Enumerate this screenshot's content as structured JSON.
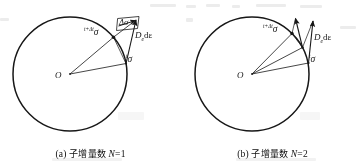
{
  "figure": {
    "kind": "scanned-textbook-figure",
    "background": "#ffffff",
    "ink": "#1a1a1a"
  },
  "panels": [
    {
      "id": "a",
      "caption_prefix": "(a)",
      "caption_cn": "子增量数",
      "caption_var": "N",
      "caption_value": "=1",
      "caption_full": "(a) 子增量数 N=1",
      "circle": {
        "cx": 70,
        "cy": 74,
        "r": 57,
        "label_center": "O"
      },
      "labels": {
        "stress_new": "σ",
        "stress_new_sup": "t+Δt",
        "stress_old": "σ",
        "stress_old_sup": "t",
        "delta_sigma": "Δσ",
        "elastic_trial": "D",
        "elastic_trial_sub": "e",
        "elastic_trial_tail": "dε"
      },
      "subincrements": 1
    },
    {
      "id": "b",
      "caption_prefix": "(b)",
      "caption_cn": "子增量数",
      "caption_var": "N",
      "caption_value": "=2",
      "caption_full": "(b) 子增量数 N=2",
      "circle": {
        "cx": 70,
        "cy": 74,
        "r": 57,
        "label_center": "O"
      },
      "labels": {
        "stress_new": "σ",
        "stress_new_sup": "t+Δt",
        "stress_old": "σ",
        "stress_old_sup": "t",
        "elastic_trial": "D",
        "elastic_trial_sub": "e",
        "elastic_trial_tail": "dε"
      },
      "subincrements": 2
    }
  ]
}
